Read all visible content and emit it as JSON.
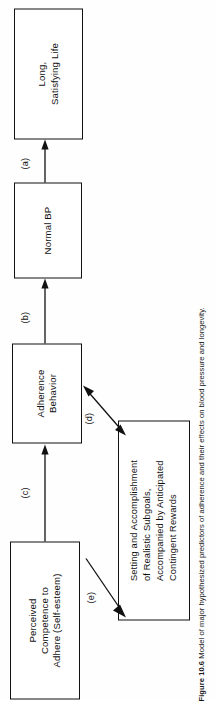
{
  "figure": {
    "caption_number": "Figure 10.6",
    "caption_text": "Model of major hypothesized predictors of adherence and their effects on blood pressure and longevity.",
    "orientation": "rotated-90-ccw",
    "colors": {
      "line": "#111111",
      "background": "#ffffff"
    }
  },
  "diagram": {
    "type": "flowchart",
    "nodes": [
      {
        "id": "perceived_competence",
        "label": "Perceived\nCompetence to\nAdhere (Self-esteem)"
      },
      {
        "id": "adherence_behavior",
        "label": "Adherence\nBehavior"
      },
      {
        "id": "normal_bp",
        "label": "Normal BP"
      },
      {
        "id": "long_life",
        "label": "Long,\nSatisfying Life"
      },
      {
        "id": "subgoals",
        "label": "Setting and Accomplishment\nof Realistic Subgoals,\nAccompanied by Anticipated\nContingent Rewards"
      }
    ],
    "edges": [
      {
        "id": "a",
        "label": "(a)",
        "from": "normal_bp",
        "to": "long_life",
        "style": "single-arrow"
      },
      {
        "id": "b",
        "label": "(b)",
        "from": "adherence_behavior",
        "to": "normal_bp",
        "style": "single-arrow"
      },
      {
        "id": "c",
        "label": "(c)",
        "from": "perceived_competence",
        "to": "adherence_behavior",
        "style": "single-arrow"
      },
      {
        "id": "d",
        "label": "(d)",
        "from": "subgoals",
        "to": "adherence_behavior",
        "style": "double-arrow"
      },
      {
        "id": "e",
        "label": "(e)",
        "from": "subgoals",
        "to": "perceived_competence",
        "style": "single-arrow"
      }
    ]
  }
}
